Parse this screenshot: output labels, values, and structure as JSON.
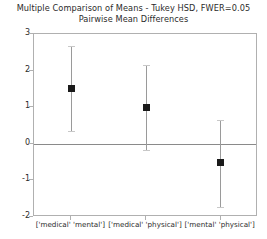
{
  "chart_data": {
    "type": "scatter",
    "title": "Multiple Comparison of Means - Tukey HSD, FWER=0.05",
    "subtitle": "Pairwise Mean Differences",
    "xlabel": "",
    "ylabel": "",
    "ylim": [
      -2,
      3
    ],
    "yticks": [
      3,
      2,
      1,
      0,
      -1,
      -2
    ],
    "ytick_labels": [
      "3",
      "2",
      "1",
      "0",
      "-1",
      "-2"
    ],
    "grid": false,
    "legend": "none",
    "zero_reference_line": 0,
    "categories": [
      "['medical' 'mental']",
      "['medical' 'physical']",
      "['mental' 'physical']"
    ],
    "values": [
      1.5,
      0.99,
      -0.51
    ],
    "ci_lower": [
      0.35,
      -0.17,
      -1.72
    ],
    "ci_upper": [
      2.67,
      2.15,
      0.66
    ],
    "series": [
      {
        "name": "Pairwise mean difference",
        "points": [
          {
            "category": "['medical' 'mental']",
            "mean": 1.5,
            "lower": 0.35,
            "upper": 2.67
          },
          {
            "category": "['medical' 'physical']",
            "mean": 0.99,
            "lower": -0.17,
            "upper": 2.15
          },
          {
            "category": "['mental' 'physical']",
            "mean": -0.51,
            "lower": -1.72,
            "upper": 0.66
          }
        ]
      }
    ],
    "colors": {
      "marker": "#1a1a1a",
      "error_bar": "#9a9a9a",
      "cap": "#c8c8c8",
      "zero_line": "#8a8a8a",
      "axis": "#b0b0b0",
      "text": "#2b2b2b",
      "background": "#ffffff"
    }
  }
}
